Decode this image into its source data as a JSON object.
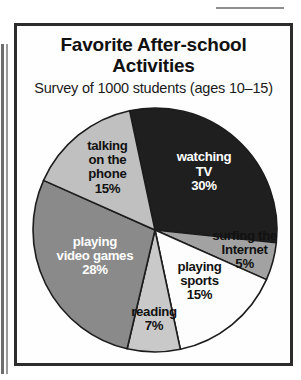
{
  "figure": {
    "title_line_1": "Favorite After-school",
    "title_line_2": "Activities",
    "subtitle": "Survey of 1000 students (ages 10–15)",
    "frame_color": "#2c2c2c",
    "background_color": "#fefefe"
  },
  "chart_data": {
    "type": "pie",
    "title": "Favorite After-school Activities",
    "subtitle": "Survey of 1000 students (ages 10–15)",
    "total_respondents": 1000,
    "value_unit": "percent",
    "start_angle_deg": -12,
    "direction": "clockwise",
    "legend": "none-inline-labels",
    "categories": [
      "watching TV",
      "surfing the Internet",
      "playing sports",
      "reading",
      "playing video games",
      "talking on the phone"
    ],
    "values": [
      30,
      5,
      15,
      7,
      28,
      15
    ],
    "slices": [
      {
        "label": "watching TV",
        "label_lines": [
          "watching",
          "TV",
          "30%"
        ],
        "value": 30,
        "display_value": "30%",
        "color": "#1f1f1f",
        "text_color": "#ffffff",
        "label_radius": 0.6
      },
      {
        "label": "surfing the Internet",
        "label_lines": [
          "surfing the",
          "Internet",
          "5%"
        ],
        "value": 5,
        "display_value": "5%",
        "color": "#a2a2a2",
        "text_color": "#111111",
        "label_radius": 0.76
      },
      {
        "label": "playing sports",
        "label_lines": [
          "playing",
          "sports",
          "15%"
        ],
        "value": 15,
        "display_value": "15%",
        "color": "#fdfdfd",
        "text_color": "#111111",
        "label_radius": 0.58
      },
      {
        "label": "reading",
        "label_lines": [
          "reading",
          "7%"
        ],
        "value": 7,
        "display_value": "7%",
        "color": "#c9c9c9",
        "text_color": "#111111",
        "label_radius": 0.76
      },
      {
        "label": "playing video games",
        "label_lines": [
          "playing",
          "video games",
          "28%"
        ],
        "value": 28,
        "display_value": "28%",
        "color": "#8a8a8a",
        "text_color": "#ffffff",
        "label_radius": 0.55
      },
      {
        "label": "talking on the phone",
        "label_lines": [
          "talking",
          "on the",
          "phone",
          "15%"
        ],
        "value": 15,
        "display_value": "15%",
        "color": "#c0c0c0",
        "text_color": "#111111",
        "label_radius": 0.62
      }
    ],
    "xlabel": "",
    "ylabel": ""
  }
}
